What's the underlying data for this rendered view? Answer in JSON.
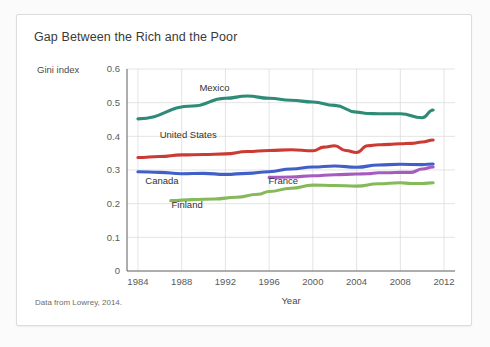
{
  "card": {
    "title": "Gap Between the Rich and the Poor",
    "ylabel_caption": "Gini index",
    "source_note": "Data from Lowrey, 2014."
  },
  "chart_data": {
    "type": "line",
    "title": "Gap Between the Rich and the Poor",
    "xlabel": "Year",
    "ylabel": "Gini index",
    "xlim": [
      1983,
      2013
    ],
    "ylim": [
      0,
      0.6
    ],
    "grid": true,
    "legend": "inline-labels",
    "xticks": [
      1984,
      1988,
      1992,
      1996,
      2000,
      2004,
      2008,
      2012
    ],
    "yticks": [
      "0",
      "0.1",
      "0.2",
      "0.3",
      "0.4",
      "0.5",
      "0.6"
    ],
    "ytick_values": [
      0,
      0.1,
      0.2,
      0.3,
      0.4,
      0.5,
      0.6
    ],
    "series": [
      {
        "name": "Mexico",
        "color": "#2e8b78",
        "label_x": 1991,
        "label_y": 0.545,
        "x": [
          1984,
          1989,
          1992,
          1994,
          1996,
          1998,
          2000,
          2002,
          2004,
          2005,
          2006,
          2008,
          2010,
          2011
        ],
        "values": [
          0.452,
          0.49,
          0.513,
          0.52,
          0.513,
          0.507,
          0.502,
          0.492,
          0.472,
          0.468,
          0.467,
          0.467,
          0.455,
          0.478
        ]
      },
      {
        "name": "United States",
        "color": "#cc3b33",
        "label_x": 1988.6,
        "label_y": 0.405,
        "x": [
          1984,
          1986,
          1988,
          1990,
          1992,
          1994,
          1996,
          1998,
          2000,
          2001,
          2002,
          2003,
          2004,
          2005,
          2006,
          2007,
          2008,
          2009,
          2010,
          2011
        ],
        "values": [
          0.337,
          0.34,
          0.345,
          0.346,
          0.348,
          0.355,
          0.358,
          0.36,
          0.357,
          0.368,
          0.372,
          0.358,
          0.352,
          0.372,
          0.375,
          0.376,
          0.378,
          0.379,
          0.383,
          0.389
        ]
      },
      {
        "name": "Canada",
        "color": "#4060c8",
        "label_x": 1986.2,
        "label_y": 0.268,
        "x": [
          1984,
          1986,
          1988,
          1990,
          1992,
          1994,
          1996,
          1998,
          2000,
          2002,
          2004,
          2006,
          2008,
          2010,
          2011
        ],
        "values": [
          0.295,
          0.293,
          0.289,
          0.29,
          0.287,
          0.29,
          0.295,
          0.303,
          0.309,
          0.312,
          0.308,
          0.315,
          0.317,
          0.316,
          0.318
        ]
      },
      {
        "name": "France",
        "color": "#a65bbf",
        "label_x": 1997.3,
        "label_y": 0.268,
        "x": [
          1996,
          1998,
          2000,
          2002,
          2004,
          2005,
          2006,
          2007,
          2008,
          2009,
          2010,
          2011
        ],
        "values": [
          0.278,
          0.279,
          0.283,
          0.286,
          0.288,
          0.289,
          0.292,
          0.292,
          0.293,
          0.293,
          0.303,
          0.309
        ]
      },
      {
        "name": "Finland",
        "color": "#86b959",
        "label_x": 1988.5,
        "label_y": 0.196,
        "x": [
          1987,
          1989,
          1991,
          1993,
          1995,
          1996,
          1998,
          2000,
          2002,
          2004,
          2006,
          2008,
          2009,
          2010,
          2011
        ],
        "values": [
          0.209,
          0.212,
          0.214,
          0.219,
          0.228,
          0.236,
          0.246,
          0.255,
          0.254,
          0.252,
          0.259,
          0.262,
          0.26,
          0.26,
          0.262
        ]
      }
    ]
  }
}
